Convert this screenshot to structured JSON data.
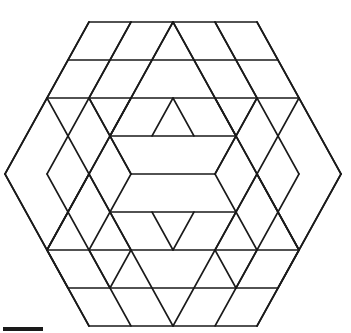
{
  "figure": {
    "stroke_color": "#1a1a1a",
    "background": "#ffffff",
    "lattice": {
      "center_x": 173,
      "center_y": 174,
      "half_side_px": 21,
      "row_px": 38
    },
    "lines": [
      [
        -4,
        -4,
        4,
        -4
      ],
      [
        -5,
        -3,
        5,
        -3
      ],
      [
        -6,
        -2,
        6,
        -2
      ],
      [
        -3,
        -1,
        3,
        -1
      ],
      [
        -2,
        0,
        2,
        0
      ],
      [
        -3,
        1,
        3,
        1
      ],
      [
        -6,
        2,
        6,
        2
      ],
      [
        -5,
        3,
        5,
        3
      ],
      [
        -4,
        4,
        4,
        4
      ],
      [
        -4,
        -4,
        -8,
        0
      ],
      [
        -8,
        0,
        -4,
        4
      ],
      [
        4,
        -4,
        8,
        0
      ],
      [
        8,
        0,
        4,
        4
      ],
      [
        -2,
        -4,
        -6,
        0
      ],
      [
        0,
        -4,
        -6,
        2
      ],
      [
        0,
        -4,
        6,
        2
      ],
      [
        2,
        -4,
        6,
        0
      ],
      [
        -6,
        0,
        -4,
        2
      ],
      [
        6,
        0,
        4,
        2
      ],
      [
        -8,
        0,
        -6,
        -2
      ],
      [
        8,
        0,
        6,
        -2
      ],
      [
        -6,
        -2,
        -2,
        2
      ],
      [
        6,
        -2,
        2,
        2
      ],
      [
        -4,
        -2,
        -2,
        0
      ],
      [
        4,
        -2,
        2,
        0
      ],
      [
        -2,
        0,
        -3,
        1
      ],
      [
        2,
        0,
        3,
        1
      ],
      [
        -3,
        -1,
        -2,
        0
      ],
      [
        3,
        -1,
        2,
        0
      ],
      [
        0,
        -2,
        -1,
        -1
      ],
      [
        0,
        -2,
        1,
        -1
      ],
      [
        -2,
        -2,
        -3,
        -1
      ],
      [
        2,
        -2,
        3,
        -1
      ],
      [
        0,
        2,
        -1,
        1
      ],
      [
        0,
        2,
        1,
        1
      ],
      [
        -6,
        2,
        -2,
        -2
      ],
      [
        6,
        2,
        2,
        -2
      ],
      [
        -8,
        0,
        -6,
        2
      ],
      [
        8,
        0,
        6,
        2
      ],
      [
        -6,
        2,
        -2,
        -2
      ],
      [
        -4,
        2,
        -2,
        4
      ],
      [
        4,
        2,
        2,
        4
      ],
      [
        -6,
        2,
        -4,
        4
      ],
      [
        6,
        2,
        4,
        4
      ],
      [
        -2,
        2,
        0,
        4
      ],
      [
        2,
        2,
        0,
        4
      ],
      [
        -4,
        2,
        -6,
        0
      ],
      [
        4,
        2,
        6,
        0
      ],
      [
        -2,
        2,
        -4,
        0
      ],
      [
        2,
        2,
        4,
        0
      ],
      [
        -3,
        -1,
        -4,
        -2
      ],
      [
        3,
        -1,
        4,
        -2
      ],
      [
        -6,
        -2,
        -4,
        -4
      ],
      [
        6,
        -2,
        4,
        -4
      ],
      [
        -4,
        -2,
        -2,
        -4
      ],
      [
        4,
        -2,
        2,
        -4
      ],
      [
        -2,
        -2,
        0,
        -4
      ],
      [
        2,
        -2,
        0,
        -4
      ],
      [
        -4,
        0,
        -6,
        2
      ],
      [
        4,
        0,
        6,
        2
      ],
      [
        -3,
        1,
        -4,
        2
      ],
      [
        3,
        1,
        4,
        2
      ],
      [
        -6,
        2,
        -5,
        3
      ],
      [
        6,
        2,
        5,
        3
      ],
      [
        -4,
        2,
        -3,
        3
      ],
      [
        4,
        2,
        3,
        3
      ],
      [
        -2,
        2,
        -3,
        3
      ],
      [
        2,
        2,
        3,
        3
      ]
    ]
  },
  "scale_bar": {
    "visible": true
  }
}
